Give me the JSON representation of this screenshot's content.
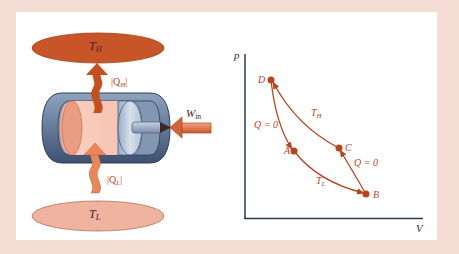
{
  "figure": {
    "colors": {
      "background": "#f5dcd5",
      "panel": "#ffffff",
      "hot_reservoir": "#c85528",
      "cold_reservoir": "#f0b3a0",
      "heat_arrow_hot": "#c4501f",
      "heat_arrow_cold": "#e8875a",
      "cylinder": "#6a7f9c",
      "gas": "#f6c4b2",
      "curve": "#b8441f",
      "axis": "#2a3a5a"
    },
    "engine": {
      "hot_reservoir_label": "T",
      "hot_reservoir_sub": "H",
      "cold_reservoir_label": "T",
      "cold_reservoir_sub": "L",
      "heat_out_label": "|Q",
      "heat_out_sub": "H",
      "heat_out_end": "|",
      "heat_in_label": "|Q",
      "heat_in_sub": "L",
      "heat_in_end": "|",
      "work_label": "W",
      "work_sub": "in"
    },
    "pv_diagram": {
      "y_axis_label": "p",
      "x_axis_label": "V",
      "points": [
        {
          "name": "D",
          "x": 271,
          "y": 80
        },
        {
          "name": "C",
          "x": 339,
          "y": 148
        },
        {
          "name": "A",
          "x": 294,
          "y": 151
        },
        {
          "name": "B",
          "x": 366,
          "y": 194
        }
      ],
      "segments": [
        {
          "from": "D",
          "to": "A",
          "label": "Q = 0",
          "type": "adiabatic"
        },
        {
          "from": "A",
          "to": "B",
          "label_main": "T",
          "label_sub": "L",
          "type": "isotherm"
        },
        {
          "from": "B",
          "to": "C",
          "label": "Q = 0",
          "type": "adiabatic"
        },
        {
          "from": "C",
          "to": "D",
          "label_main": "T",
          "label_sub": "H",
          "type": "isotherm"
        }
      ]
    }
  }
}
